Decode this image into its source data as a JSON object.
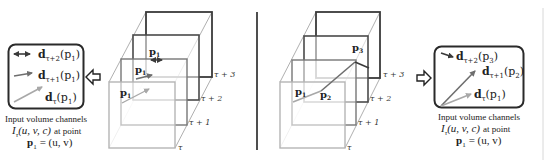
{
  "colors": {
    "dark": "#3a3a3a",
    "mid": "#6e6e6e",
    "light": "#a8a8a8",
    "lighter": "#c8c8c8",
    "text": "#222222"
  },
  "left_panel": {
    "box_labels": [
      {
        "vec": "d",
        "sub": "τ+2",
        "arg": "(p",
        "argsub": "1",
        "close": ")"
      },
      {
        "vec": "d",
        "sub": "τ+1",
        "arg": "(p",
        "argsub": "1",
        "close": ")"
      },
      {
        "vec": "d",
        "sub": "τ",
        "arg": "(p",
        "argsub": "1",
        "close": ")"
      }
    ],
    "caption": {
      "line1": "Input volume channels",
      "line2_math": "I",
      "line2_sub": "τ",
      "line2_args": "(u, v, c)",
      "line2_text": "at point",
      "line3_p": "p",
      "line3_sub": "1",
      "line3_rest": "= (u, v)"
    },
    "cube": {
      "frame_labels": [
        "τ",
        "τ + 1",
        "τ + 2",
        "τ + 3"
      ],
      "point_labels": [
        {
          "p": "p",
          "sub": "1"
        },
        {
          "p": "p",
          "sub": "1"
        },
        {
          "p": "p",
          "sub": "1"
        }
      ]
    }
  },
  "right_panel": {
    "box_labels": [
      {
        "vec": "d",
        "sub": "τ+2",
        "arg": "(p",
        "argsub": "3",
        "close": ")"
      },
      {
        "vec": "d",
        "sub": "τ+1",
        "arg": "(p",
        "argsub": "2",
        "close": ")"
      },
      {
        "vec": "d",
        "sub": "τ",
        "arg": "(p",
        "argsub": "1",
        "close": ")"
      }
    ],
    "caption": {
      "line1": "Input volume channels",
      "line2_math": "I",
      "line2_sub": "τ",
      "line2_args": "(u, v, c)",
      "line2_text": "at point",
      "line3_p": "p",
      "line3_sub": "1",
      "line3_rest": "= (u, v)"
    },
    "cube": {
      "frame_labels": [
        "τ",
        "τ + 1",
        "τ + 2",
        "τ + 3"
      ],
      "point_labels": [
        {
          "p": "p",
          "sub": "1"
        },
        {
          "p": "p",
          "sub": "2"
        },
        {
          "p": "p",
          "sub": "3"
        }
      ]
    }
  }
}
